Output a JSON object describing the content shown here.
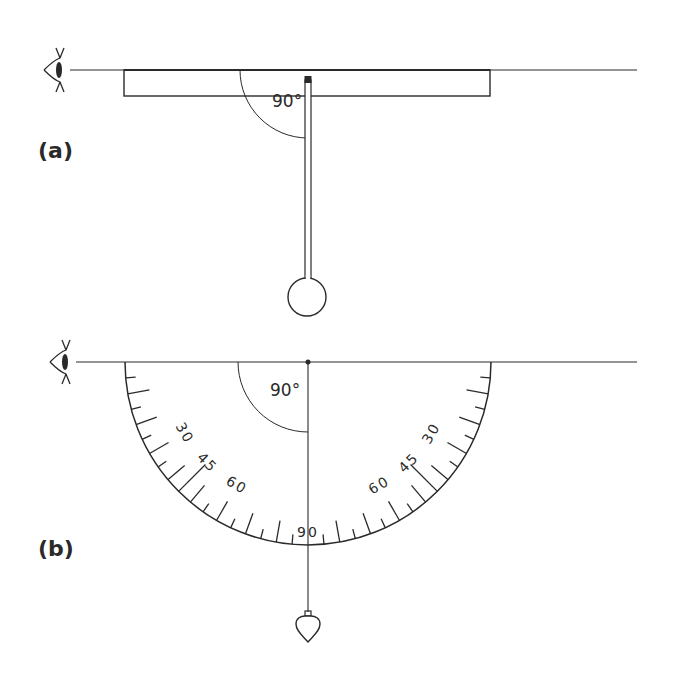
{
  "figure": {
    "ink_color": "#2a2a2a",
    "background": "#ffffff",
    "panel_a": {
      "label": "(a)",
      "sight_line": {
        "y": 70,
        "x1": 70,
        "x2": 637
      },
      "eye": {
        "x": 58,
        "y": 70
      },
      "ruler": {
        "x": 124,
        "y": 70,
        "width": 366,
        "height": 26
      },
      "pivot": {
        "x": 308,
        "y": 76
      },
      "stem": {
        "x": 308,
        "y1": 80,
        "y2": 279,
        "width": 6
      },
      "bob": {
        "cx": 307,
        "cy": 297,
        "r": 19
      },
      "angle_arc": {
        "cx": 308,
        "cy": 70,
        "r": 68
      },
      "angle_label": "90°"
    },
    "panel_b": {
      "label": "(b)",
      "sight_line": {
        "y": 362,
        "x1": 76,
        "x2": 637
      },
      "eye": {
        "x": 64,
        "y": 362
      },
      "protractor": {
        "cx": 308,
        "cy": 362,
        "r": 183
      },
      "tick_step_deg": 5,
      "tick_short": 10,
      "tick_long": 22,
      "tick_45_len": 38,
      "scale_labels": [
        {
          "text": "30",
          "angle": 30,
          "side": "left"
        },
        {
          "text": "45",
          "angle": 45,
          "side": "left"
        },
        {
          "text": "60",
          "angle": 60,
          "side": "left"
        },
        {
          "text": "90",
          "angle": 90,
          "side": "center"
        },
        {
          "text": "60",
          "angle": 60,
          "side": "right"
        },
        {
          "text": "45",
          "angle": 45,
          "side": "right"
        },
        {
          "text": "30",
          "angle": 30,
          "side": "right"
        }
      ],
      "plumb_line": {
        "x": 308,
        "y1": 362,
        "y2": 612
      },
      "plumb_bob": {
        "x": 308,
        "y": 612
      },
      "angle_arc": {
        "cx": 308,
        "cy": 362,
        "r": 70
      },
      "angle_label": "90°"
    }
  }
}
